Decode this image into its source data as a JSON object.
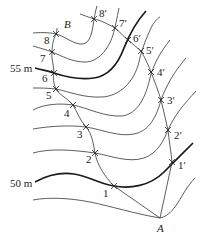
{
  "figure": {
    "labels": {
      "contour_55": "55 m",
      "contour_50": "50 m",
      "point_B": "B",
      "point_A": "A"
    },
    "left_points": [
      {
        "label": "8",
        "x": 56,
        "y": 34,
        "lx": 44,
        "ly": 44
      },
      {
        "label": "7",
        "x": 52,
        "y": 52,
        "lx": 40,
        "ly": 62
      },
      {
        "label": "6",
        "x": 54,
        "y": 73,
        "lx": 42,
        "ly": 82
      },
      {
        "label": "5",
        "x": 56,
        "y": 89,
        "lx": 46,
        "ly": 99
      },
      {
        "label": "4",
        "x": 73,
        "y": 105,
        "lx": 64,
        "ly": 117
      },
      {
        "label": "3",
        "x": 86,
        "y": 127,
        "lx": 77,
        "ly": 138
      },
      {
        "label": "2",
        "x": 95,
        "y": 153,
        "lx": 86,
        "ly": 163
      },
      {
        "label": "1",
        "x": 114,
        "y": 186,
        "lx": 103,
        "ly": 197
      }
    ],
    "right_points": [
      {
        "label": "8′",
        "x": 94,
        "y": 19,
        "lx": 99,
        "ly": 17
      },
      {
        "label": "7′",
        "x": 115,
        "y": 28,
        "lx": 119,
        "ly": 27
      },
      {
        "label": "6′",
        "x": 128,
        "y": 40,
        "lx": 133,
        "ly": 42
      },
      {
        "label": "5′",
        "x": 141,
        "y": 51,
        "lx": 146,
        "ly": 54
      },
      {
        "label": "4′",
        "x": 151,
        "y": 72,
        "lx": 157,
        "ly": 76
      },
      {
        "label": "3′",
        "x": 161,
        "y": 100,
        "lx": 167,
        "ly": 104
      },
      {
        "label": "2′",
        "x": 168,
        "y": 130,
        "lx": 174,
        "ly": 139
      },
      {
        "label": "1′",
        "x": 172,
        "y": 162,
        "lx": 178,
        "ly": 169
      }
    ],
    "A": {
      "x": 160,
      "y": 218
    }
  }
}
